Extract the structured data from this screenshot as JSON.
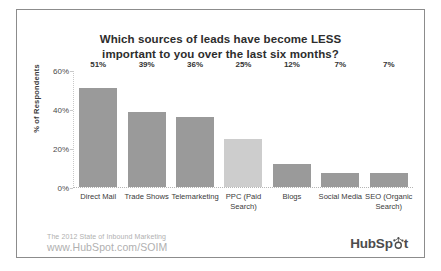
{
  "chart_data": {
    "type": "bar",
    "title": "Which sources of leads have become LESS important to you over the last six months?",
    "title_lines": [
      "Which sources of leads have become LESS",
      "important to you over the last six months?"
    ],
    "xlabel": "",
    "ylabel": "% of Respondents",
    "ylim": [
      0,
      60
    ],
    "ytick_labels": [
      "0%",
      "20%",
      "40%",
      "60%"
    ],
    "ytick_values": [
      0,
      20,
      40,
      60
    ],
    "grid": false,
    "legend": "none",
    "categories": [
      "Direct Mail",
      "Trade Shows",
      "Telemarketing",
      "PPC (Paid Search)",
      "Blogs",
      "Social Media",
      "SEO (Organic Search)"
    ],
    "category_lines": [
      [
        "Direct Mail"
      ],
      [
        "Trade Shows"
      ],
      [
        "Telemarketing"
      ],
      [
        "PPC (Paid",
        "Search)"
      ],
      [
        "Blogs"
      ],
      [
        "Social Media"
      ],
      [
        "SEO (Organic",
        "Search)"
      ]
    ],
    "values": [
      51,
      39,
      36,
      25,
      12,
      7,
      7
    ],
    "value_labels": [
      "51%",
      "39%",
      "36%",
      "25%",
      "12%",
      "7%",
      "7%"
    ],
    "bar_colors": [
      "#9a9a9a",
      "#9a9a9a",
      "#9a9a9a",
      "#cdcdcd",
      "#9a9a9a",
      "#9a9a9a",
      "#9a9a9a"
    ],
    "highlighted_index": 3
  },
  "footer": {
    "source_line1": "The 2012 State of Inbound Marketing",
    "source_line2": "www.HubSpot.com/SOIM"
  },
  "brand": {
    "name_before": "HubSp",
    "name_after": "t",
    "full_name": "HubSpot"
  },
  "colors": {
    "bar_default": "#9a9a9a",
    "bar_highlight": "#cdcdcd",
    "title_text": "#2d2d2d",
    "footer_text": "#b0b0b0",
    "frame_border": "#8c8c8c"
  }
}
